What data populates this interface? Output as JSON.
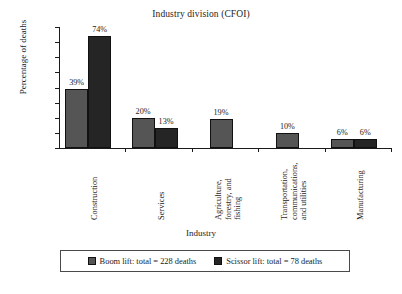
{
  "chart_data": {
    "type": "bar",
    "title": "Industry division (CFOI)",
    "xlabel": "Industry",
    "ylabel": "Percentage of deaths",
    "ylim": [
      0,
      80
    ],
    "ytick_labels": [
      "0%",
      "10%",
      "20%",
      "30%",
      "40%",
      "50%",
      "60%",
      "70%",
      "80%"
    ],
    "ytick_values": [
      0,
      10,
      20,
      30,
      40,
      50,
      60,
      70,
      80
    ],
    "grid": false,
    "legend_position": "bottom",
    "categories": [
      "Construction",
      "Services",
      "Agriculture, forestry, and fishing",
      "Transportation, communications, and utilities",
      "Manufacturing"
    ],
    "category_lines": [
      [
        "Construction"
      ],
      [
        "Services"
      ],
      [
        "Agriculture,",
        "forestry, and",
        "fishing"
      ],
      [
        "Transportation,",
        "communications,",
        "and utilities"
      ],
      [
        "Manufacturing"
      ]
    ],
    "series": [
      {
        "name": "Boom lift: total = 228 deaths",
        "color": "#555555",
        "values": [
          39,
          20,
          19,
          10,
          6
        ],
        "labels": [
          "39%",
          "20%",
          "19%",
          "10%",
          "6%"
        ]
      },
      {
        "name": "Scissor lift: total = 78 deaths",
        "color": "#252525",
        "values": [
          74,
          13,
          null,
          null,
          6
        ],
        "labels": [
          "74%",
          "13%",
          null,
          null,
          "6%"
        ]
      }
    ]
  },
  "legend": {
    "entries": [
      {
        "label": "Boom lift: total = 228 deaths",
        "swatch": "boom"
      },
      {
        "label": "Scissor lift: total = 78 deaths",
        "swatch": "scissor"
      }
    ]
  }
}
